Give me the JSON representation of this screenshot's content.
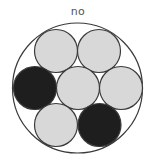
{
  "title": "no",
  "outer_circle": {
    "cx": 77.5,
    "cy": 88,
    "r": 65,
    "stroke": "#3a3a3a",
    "fill": "#ffffff"
  },
  "inner_circles": [
    {
      "position": "top-left",
      "cx": 56,
      "cy": 51,
      "r": 21.5,
      "state": "light",
      "fill": "#d8d8d8"
    },
    {
      "position": "top-right",
      "cx": 99,
      "cy": 51,
      "r": 21.5,
      "state": "light",
      "fill": "#d8d8d8"
    },
    {
      "position": "middle-left",
      "cx": 35,
      "cy": 88,
      "r": 21.5,
      "state": "dark",
      "fill": "#1e1e1e"
    },
    {
      "position": "center",
      "cx": 78,
      "cy": 88,
      "r": 21.5,
      "state": "light",
      "fill": "#d8d8d8"
    },
    {
      "position": "middle-right",
      "cx": 121,
      "cy": 88,
      "r": 21.5,
      "state": "light",
      "fill": "#d8d8d8"
    },
    {
      "position": "bottom-left",
      "cx": 56,
      "cy": 125,
      "r": 21.5,
      "state": "light",
      "fill": "#d8d8d8"
    },
    {
      "position": "bottom-right",
      "cx": 99.5,
      "cy": 125,
      "r": 21.5,
      "state": "dark",
      "fill": "#1e1e1e"
    }
  ],
  "colors": {
    "light": "#d8d8d8",
    "dark": "#1e1e1e",
    "stroke": "#3a3a3a",
    "label": "#555555"
  }
}
